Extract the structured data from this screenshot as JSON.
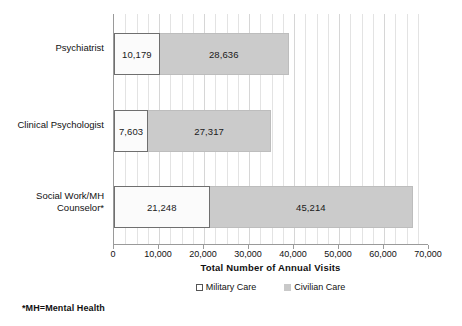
{
  "chart_data": {
    "type": "bar",
    "orientation": "horizontal",
    "stacked": true,
    "title": "",
    "xlabel": "Total Number of Annual Visits",
    "ylabel": "",
    "xlim": [
      0,
      70000
    ],
    "xticks": [
      "0",
      "10,000",
      "20,000",
      "30,000",
      "40,000",
      "50,000",
      "60,000",
      "70,000"
    ],
    "xtick_values": [
      0,
      10000,
      20000,
      30000,
      40000,
      50000,
      60000,
      70000
    ],
    "grid": "vertical-minor",
    "legend_position": "bottom-center",
    "categories": [
      "Psychiatrist",
      "Clinical Psychologist",
      "Social Work/MH\nCounselor*"
    ],
    "series": [
      {
        "name": "Military Care",
        "color": "#ffffff",
        "pattern": "dotted",
        "values": [
          10179,
          7603,
          21248
        ],
        "labels": [
          "10,179",
          "7,603",
          "21,248"
        ]
      },
      {
        "name": "Civilian Care",
        "color": "#cbcbcb",
        "pattern": "solid",
        "values": [
          28636,
          27317,
          45214
        ],
        "labels": [
          "28,636",
          "27,317",
          "45,214"
        ]
      }
    ],
    "annotations": [
      "*MH=Mental Health"
    ]
  },
  "chart": {
    "axis_title": "Total Number of Annual Visits",
    "footnote": "*MH=Mental Health",
    "legend": [
      {
        "label": "Military Care",
        "swatch": "military-swatch"
      },
      {
        "label": "Civilian Care",
        "swatch": "civilian-swatch"
      }
    ],
    "rows": [
      {
        "category": "Psychiatrist",
        "military_label": "10,179",
        "civilian_label": "28,636",
        "military_value": 10179,
        "civilian_value": 28636
      },
      {
        "category": "Clinical Psychologist",
        "military_label": "7,603",
        "civilian_label": "27,317",
        "military_value": 7603,
        "civilian_value": 27317
      },
      {
        "category": "Social Work/MH\nCounselor*",
        "military_label": "21,248",
        "civilian_label": "45,214",
        "military_value": 21248,
        "civilian_value": 45214
      }
    ],
    "ticks": [
      "0",
      "10,000",
      "20,000",
      "30,000",
      "40,000",
      "50,000",
      "60,000",
      "70,000"
    ]
  }
}
